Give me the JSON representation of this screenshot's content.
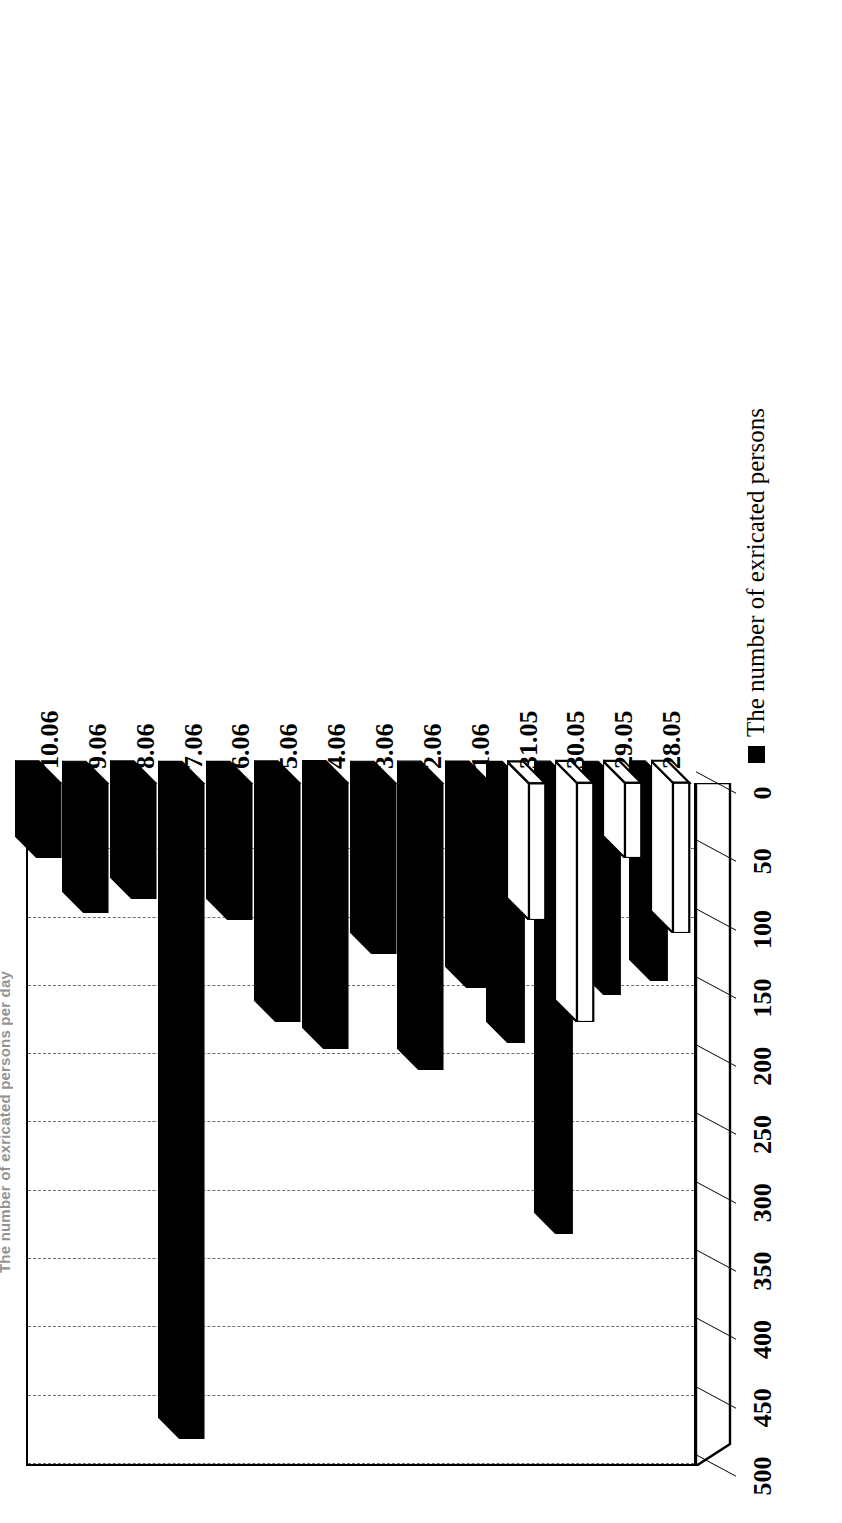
{
  "chart_data": {
    "type": "bar",
    "orientation": "horizontal-3d",
    "title": "The number of exricated persons per day",
    "xlabel": "",
    "ylabel": "",
    "xlim": [
      0,
      500
    ],
    "grid": true,
    "grid_axis": "value",
    "legend_position": "bottom-right",
    "value_ticks": [
      "0",
      "50",
      "100",
      "150",
      "200",
      "250",
      "300",
      "350",
      "400",
      "450",
      "500"
    ],
    "value_tick_numbers": [
      0,
      50,
      100,
      150,
      200,
      250,
      300,
      350,
      400,
      450,
      500
    ],
    "categories": [
      "28.05",
      "29.05",
      "30.05",
      "31.05",
      "1.06",
      "2.06",
      "3.06",
      "4.06",
      "5.06",
      "6.06",
      "7.06",
      "8.06",
      "9.06",
      "10.06"
    ],
    "series": [
      {
        "name": "The number of exricated persons",
        "color": "#000000",
        "style": "solid-black",
        "values": [
          145,
          155,
          330,
          190,
          150,
          210,
          125,
          195,
          175,
          100,
          480,
          85,
          95,
          55
        ]
      },
      {
        "name": "",
        "color": "#ffffff",
        "style": "white-outlined",
        "values": [
          110,
          55,
          175,
          100,
          null,
          null,
          null,
          null,
          null,
          null,
          null,
          null,
          null,
          null
        ]
      }
    ]
  },
  "legend": {
    "items": [
      {
        "marker": "black-square-icon",
        "label": "The number of exricated persons"
      }
    ]
  },
  "axes": {
    "value_axis_name": "value-axis",
    "category_axis_name": "category-axis"
  },
  "colors": {
    "bar_primary": "#000000",
    "bar_secondary": "#ffffff",
    "axis": "#000000",
    "grid": "#555555",
    "background": "#ffffff"
  }
}
